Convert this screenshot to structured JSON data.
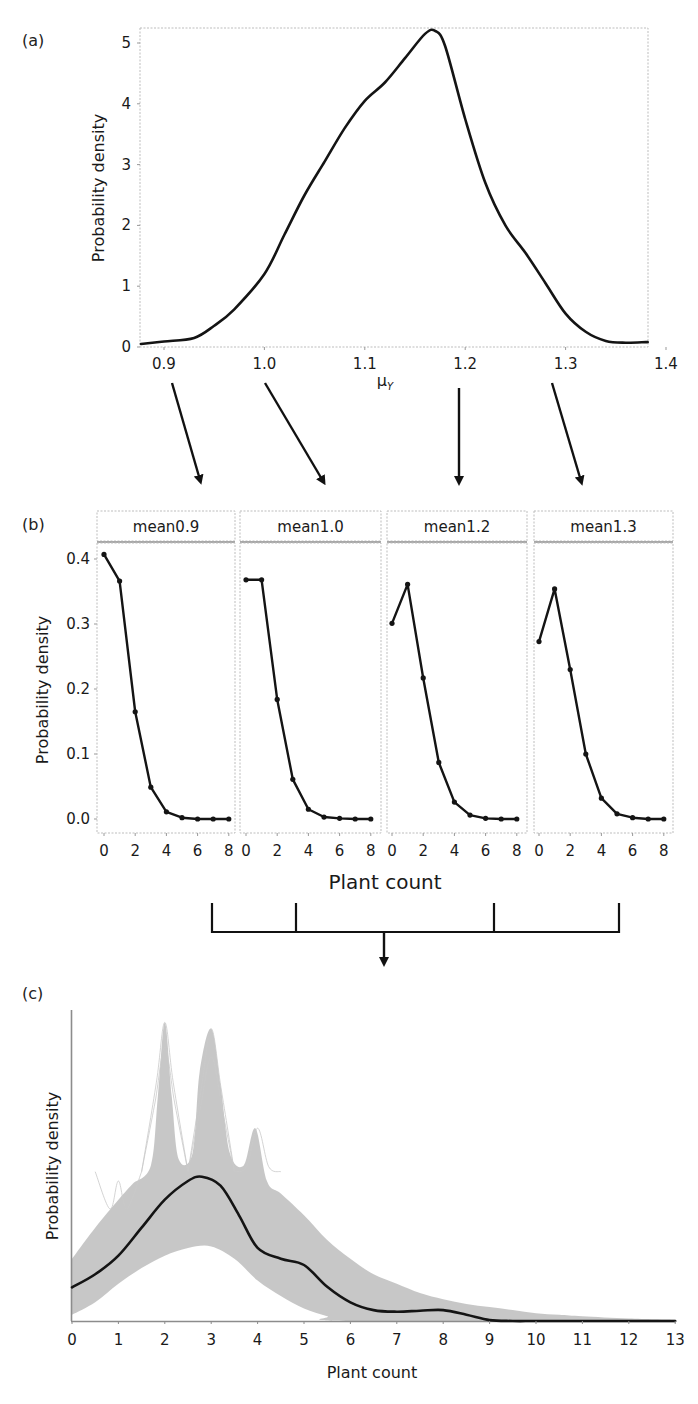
{
  "figure": {
    "panels": {
      "a": {
        "label": "(a)"
      },
      "b": {
        "label": "(b)"
      },
      "c": {
        "label": "(c)"
      }
    }
  },
  "chart_data": [
    {
      "id": "a",
      "type": "line",
      "title": "",
      "xlabel": "μY",
      "xlabel_main": "μ",
      "xlabel_sub": "Y",
      "ylabel": "Probability density",
      "xlim": [
        0.875,
        1.41
      ],
      "ylim": [
        0,
        5.2
      ],
      "xticks": [
        0.9,
        1.0,
        1.1,
        1.2,
        1.3,
        1.4
      ],
      "xtick_labels": [
        "0.9",
        "1.0",
        "1.1",
        "1.2",
        "1.3",
        "1.4"
      ],
      "yticks": [
        0,
        1,
        2,
        3,
        4,
        5
      ],
      "ytick_labels": [
        "0",
        "1",
        "2",
        "3",
        "4",
        "5"
      ],
      "grid": false,
      "series": [
        {
          "name": "posterior density",
          "x": [
            0.875,
            0.9,
            0.93,
            0.95,
            0.97,
            1.0,
            1.02,
            1.04,
            1.06,
            1.08,
            1.1,
            1.12,
            1.14,
            1.16,
            1.17,
            1.18,
            1.2,
            1.22,
            1.24,
            1.26,
            1.28,
            1.3,
            1.32,
            1.34,
            1.36,
            1.38,
            1.405
          ],
          "y": [
            0.05,
            0.09,
            0.15,
            0.35,
            0.62,
            1.2,
            1.85,
            2.5,
            3.05,
            3.6,
            4.05,
            4.35,
            4.75,
            5.15,
            5.2,
            4.95,
            3.75,
            2.7,
            2.0,
            1.55,
            1.05,
            0.55,
            0.25,
            0.1,
            0.07,
            0.08,
            0.08
          ]
        }
      ]
    },
    {
      "id": "b",
      "type": "line",
      "title": "",
      "xlabel": "Plant count",
      "ylabel": "Probability density",
      "ylim": [
        -0.015,
        0.43
      ],
      "yticks": [
        0.0,
        0.1,
        0.2,
        0.3,
        0.4
      ],
      "ytick_labels": [
        "0.0",
        "0.1",
        "0.2",
        "0.3",
        "0.4"
      ],
      "xticks": [
        0,
        2,
        4,
        6,
        8
      ],
      "xtick_labels": [
        "0",
        "2",
        "4",
        "6",
        "8"
      ],
      "grid": false,
      "categories": [
        0,
        1,
        2,
        3,
        4,
        5,
        6,
        7,
        8
      ],
      "facets": [
        {
          "strip": "mean0.9",
          "values": [
            0.407,
            0.366,
            0.165,
            0.049,
            0.011,
            0.002,
            0.0,
            0.0,
            0.0
          ]
        },
        {
          "strip": "mean1.0",
          "values": [
            0.368,
            0.368,
            0.184,
            0.061,
            0.015,
            0.003,
            0.001,
            0.0,
            0.0
          ]
        },
        {
          "strip": "mean1.2",
          "values": [
            0.301,
            0.361,
            0.217,
            0.087,
            0.026,
            0.006,
            0.001,
            0.0,
            0.0
          ]
        },
        {
          "strip": "mean1.3",
          "values": [
            0.273,
            0.354,
            0.23,
            0.1,
            0.032,
            0.008,
            0.002,
            0.0,
            0.0
          ]
        }
      ]
    },
    {
      "id": "c",
      "type": "line",
      "title": "",
      "xlabel": "Plant count",
      "ylabel": "Probability density",
      "xlim": [
        0,
        13
      ],
      "xticks": [
        0,
        1,
        2,
        3,
        4,
        5,
        6,
        7,
        8,
        9,
        10,
        11,
        12,
        13
      ],
      "xtick_labels": [
        "0",
        "1",
        "2",
        "3",
        "4",
        "5",
        "6",
        "7",
        "8",
        "9",
        "10",
        "11",
        "12",
        "13"
      ],
      "yticks": [],
      "grid": false,
      "note": "y-axis unlabelled; values below in relative units (0 = baseline, 1 = top of axis)",
      "series": [
        {
          "name": "mean density",
          "color": "#141414",
          "x": [
            0,
            0.5,
            1,
            1.5,
            2,
            2.5,
            2.8,
            3.2,
            3.6,
            4,
            4.5,
            5,
            5.5,
            6,
            6.5,
            7,
            7.5,
            8,
            8.5,
            9,
            9.5,
            10,
            11,
            12,
            13
          ],
          "y": [
            0.108,
            0.15,
            0.21,
            0.3,
            0.39,
            0.45,
            0.464,
            0.435,
            0.34,
            0.235,
            0.2,
            0.18,
            0.11,
            0.06,
            0.035,
            0.03,
            0.033,
            0.035,
            0.02,
            0.003,
            0.0,
            0.0,
            0.0,
            0.0,
            0.0
          ]
        },
        {
          "name": "simulation envelope (upper)",
          "color": "#b4b4b4",
          "x": [
            0,
            0.5,
            1,
            1.3,
            1.7,
            1.85,
            2.0,
            2.15,
            2.3,
            2.6,
            2.75,
            3.0,
            3.2,
            3.4,
            3.7,
            3.95,
            4.2,
            4.5,
            5,
            5.5,
            6,
            6.5,
            7,
            7.5,
            8,
            8.5,
            9,
            9.5,
            10,
            10.5,
            11,
            12,
            13
          ],
          "y": [
            0.2,
            0.3,
            0.39,
            0.44,
            0.5,
            0.72,
            0.96,
            0.72,
            0.52,
            0.54,
            0.8,
            0.94,
            0.76,
            0.54,
            0.5,
            0.62,
            0.45,
            0.41,
            0.34,
            0.26,
            0.2,
            0.15,
            0.12,
            0.09,
            0.07,
            0.055,
            0.045,
            0.035,
            0.025,
            0.02,
            0.015,
            0.008,
            0.004
          ]
        },
        {
          "name": "simulation envelope (lower)",
          "color": "#b4b4b4",
          "x": [
            0,
            0.5,
            1,
            1.5,
            2,
            2.5,
            3,
            3.5,
            4,
            4.5,
            5,
            5.5,
            6,
            13
          ],
          "y": [
            0.02,
            0.06,
            0.12,
            0.17,
            0.21,
            0.235,
            0.24,
            0.2,
            0.13,
            0.08,
            0.04,
            0.015,
            0.0,
            0.0
          ]
        }
      ]
    }
  ],
  "connectors": {
    "a_to_b_arrows": [
      {
        "from_tick": "0.9",
        "to_facet": "mean0.9"
      },
      {
        "from_tick": "1.0",
        "to_facet": "mean1.0"
      },
      {
        "from_tick": "1.2",
        "to_facet": "mean1.2"
      },
      {
        "from_tick": "1.3",
        "to_facet": "mean1.3"
      }
    ],
    "b_to_c": "bracket merging the four facets with a single down arrow"
  }
}
